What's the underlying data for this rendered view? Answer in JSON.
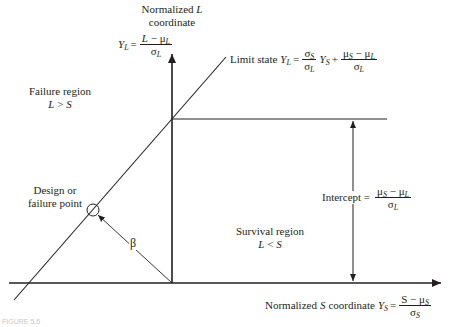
{
  "diagram": {
    "type": "reliability-limit-state-plot",
    "colors": {
      "line": "#231f20",
      "background": "#ffffff"
    },
    "y_axis": {
      "title_line1": "Normalized L",
      "title_line1_prefix": "Normalized ",
      "title_line1_var": "L",
      "title_line2": "coordinate",
      "formula_lhs": "Y",
      "formula_lhs_sub": "L",
      "formula_eq": "=",
      "formula_num": "L − μ",
      "formula_num_var": "L",
      "formula_num_op": " − μ",
      "formula_num_sub": "L",
      "formula_den": "σ",
      "formula_den_sub": "L"
    },
    "x_axis": {
      "title_prefix": "Normalized ",
      "title_var": "S",
      "title_suffix": " coordinate ",
      "formula_lhs": "Y",
      "formula_lhs_sub": "S",
      "formula_eq": "=",
      "formula_num_var": "S",
      "formula_num_op": " − μ",
      "formula_num_sub": "S",
      "formula_den": "σ",
      "formula_den_sub": "S"
    },
    "limit_state": {
      "label": "Limit state ",
      "lhs": "Y",
      "lhs_sub": "L",
      "eq": "=",
      "frac1_num": "σ",
      "frac1_num_sub": "S",
      "frac1_den": "σ",
      "frac1_den_sub": "L",
      "mid": "Y",
      "mid_sub": "S",
      "plus": "+",
      "frac2_num_a": "μ",
      "frac2_num_a_sub": "S",
      "frac2_num_op": " − μ",
      "frac2_num_b_sub": "L",
      "frac2_den": "σ",
      "frac2_den_sub": "L"
    },
    "failure_region": {
      "title": "Failure region",
      "cond_a": "L",
      "cond_op": " > ",
      "cond_b": "S"
    },
    "survival_region": {
      "title": "Survival region",
      "cond_a": "L",
      "cond_op": " < ",
      "cond_b": "S"
    },
    "design_point": {
      "line1": "Design or",
      "line2": "failure point"
    },
    "beta": {
      "symbol": "β"
    },
    "intercept": {
      "label": "Intercept =",
      "num_a": "μ",
      "num_a_sub": "S",
      "num_op": " − μ",
      "num_b_sub": "L",
      "den": "σ",
      "den_sub": "L"
    },
    "caption_fragment": "FIGURE 5.5"
  }
}
